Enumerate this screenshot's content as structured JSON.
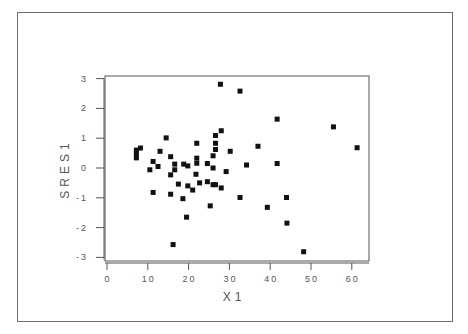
{
  "chart_data": {
    "type": "scatter",
    "title": "",
    "xlabel": "X1",
    "ylabel": "SRES1",
    "xlim": [
      0,
      62
    ],
    "ylim": [
      -3,
      3
    ],
    "x_ticks": [
      "0",
      "10",
      "20",
      "30",
      "40",
      "50",
      "60"
    ],
    "y_ticks": [
      "3",
      "2",
      "1",
      "0",
      "-1",
      "-2",
      "-3"
    ],
    "grid": false,
    "legend": null,
    "marker": "square",
    "marker_color": "#111111",
    "series": [
      {
        "name": "SRES1 vs X1",
        "points": [
          [
            27.8,
            2.81
          ],
          [
            32.6,
            2.58
          ],
          [
            41.7,
            1.64
          ],
          [
            55.5,
            1.38
          ],
          [
            61.3,
            0.68
          ],
          [
            14.5,
            1.01
          ],
          [
            28.0,
            1.25
          ],
          [
            26.6,
            1.09
          ],
          [
            26.6,
            0.83
          ],
          [
            26.6,
            0.62
          ],
          [
            22.0,
            0.83
          ],
          [
            37.0,
            0.73
          ],
          [
            30.2,
            0.56
          ],
          [
            13.0,
            0.56
          ],
          [
            8.2,
            0.67
          ],
          [
            7.2,
            0.6
          ],
          [
            7.2,
            0.46
          ],
          [
            7.2,
            0.34
          ],
          [
            15.6,
            0.38
          ],
          [
            26.0,
            0.41
          ],
          [
            22.0,
            0.33
          ],
          [
            22.0,
            0.16
          ],
          [
            24.6,
            0.15
          ],
          [
            11.3,
            0.22
          ],
          [
            12.5,
            0.05
          ],
          [
            10.5,
            -0.06
          ],
          [
            16.6,
            0.13
          ],
          [
            16.6,
            -0.06
          ],
          [
            18.8,
            0.13
          ],
          [
            19.8,
            0.07
          ],
          [
            26.0,
            0.0
          ],
          [
            34.2,
            0.1
          ],
          [
            41.7,
            0.15
          ],
          [
            29.2,
            -0.12
          ],
          [
            21.8,
            -0.21
          ],
          [
            15.6,
            -0.23
          ],
          [
            17.5,
            -0.54
          ],
          [
            19.8,
            -0.6
          ],
          [
            22.7,
            -0.5
          ],
          [
            24.6,
            -0.46
          ],
          [
            26.0,
            -0.56
          ],
          [
            26.6,
            -0.56
          ],
          [
            28.0,
            -0.67
          ],
          [
            21.0,
            -0.74
          ],
          [
            11.3,
            -0.82
          ],
          [
            15.6,
            -0.88
          ],
          [
            18.6,
            -1.03
          ],
          [
            32.6,
            -0.99
          ],
          [
            44.0,
            -0.99
          ],
          [
            25.3,
            -1.27
          ],
          [
            39.3,
            -1.32
          ],
          [
            19.5,
            -1.65
          ],
          [
            44.1,
            -1.85
          ],
          [
            16.2,
            -2.57
          ],
          [
            48.2,
            -2.81
          ]
        ]
      }
    ]
  }
}
